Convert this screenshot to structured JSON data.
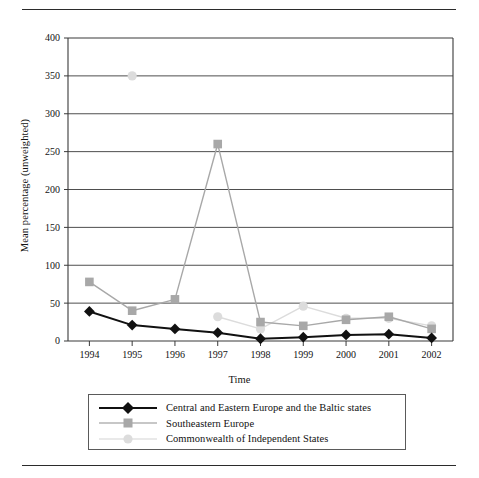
{
  "figure": {
    "has_top_rule": true,
    "has_bottom_rule": true,
    "background_color": "#ffffff"
  },
  "chart_data": {
    "type": "line",
    "title": "",
    "subtitle": "",
    "xlabel": "Time",
    "ylabel": "Mean percentage (unweighted)",
    "categories": [
      "1994",
      "1995",
      "1996",
      "1997",
      "1998",
      "1999",
      "2000",
      "2001",
      "2002"
    ],
    "x": [
      1994,
      1995,
      1996,
      1997,
      1998,
      1999,
      2000,
      2001,
      2002
    ],
    "xlim": [
      1993.5,
      2002.5
    ],
    "ylim": [
      0,
      400
    ],
    "yticks": [
      0,
      50,
      100,
      150,
      200,
      250,
      300,
      350,
      400
    ],
    "ytick_labels": [
      "0",
      "50",
      "100",
      "150",
      "200",
      "250",
      "300",
      "350",
      "400"
    ],
    "grid": "horizontal",
    "legend_position": "below-axes",
    "series": [
      {
        "name": "Central and Eastern Europe and the Baltic states",
        "color": "#111111",
        "marker": "diamond",
        "line_width": 2.0,
        "values": [
          39,
          21,
          16,
          11,
          3,
          5,
          8,
          9,
          4
        ]
      },
      {
        "name": "Southeastern Europe",
        "color": "#a8a8a8",
        "marker": "square",
        "line_width": 1.4,
        "values": [
          78,
          40,
          55,
          260,
          25,
          20,
          28,
          32,
          16
        ]
      },
      {
        "name": "Commonwealth of Independent States",
        "color": "#dcdcdc",
        "marker": "circle",
        "line_width": 1.4,
        "values": [
          null,
          350,
          null,
          32,
          16,
          46,
          30,
          30,
          20
        ]
      }
    ]
  },
  "legend": {
    "entries": [
      {
        "label": "Central and Eastern Europe and the Baltic states",
        "marker": "diamond",
        "color": "#111111"
      },
      {
        "label": "Southeastern Europe",
        "marker": "square",
        "color": "#a8a8a8"
      },
      {
        "label": "Commonwealth of Independent States",
        "marker": "circle",
        "color": "#dcdcdc"
      }
    ]
  }
}
